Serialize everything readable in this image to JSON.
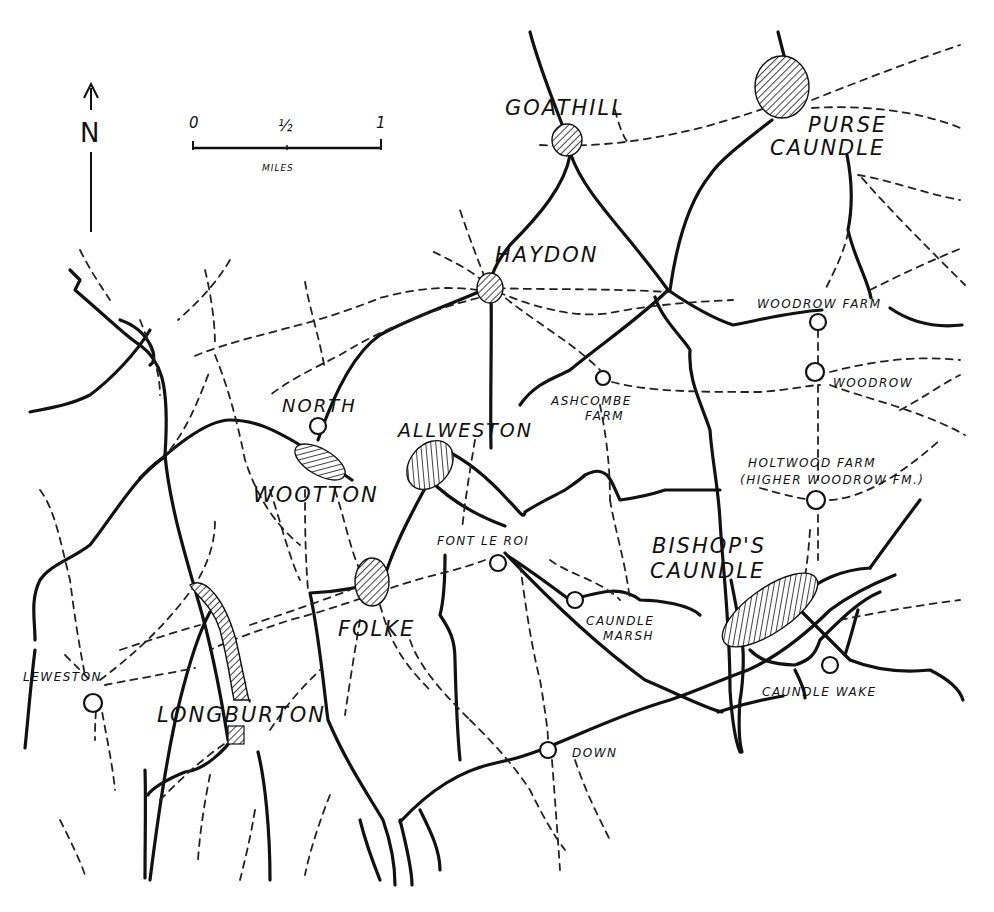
{
  "north_arrow": {
    "label": "N"
  },
  "scale_bar": {
    "ticks": [
      "0",
      "½",
      "1"
    ],
    "unit": "MILES"
  },
  "legend_colors": {
    "ink": "#111111",
    "paper": "#ffffff"
  },
  "villages": [
    {
      "id": "goathill",
      "name": "GOATHILL",
      "symbol": "hatched-settlement"
    },
    {
      "id": "purse-caundle",
      "name_line1": "PURSE",
      "name_line2": "CAUNDLE",
      "symbol": "hatched-settlement"
    },
    {
      "id": "haydon",
      "name": "HAYDON",
      "symbol": "hatched-settlement"
    },
    {
      "id": "north-wootton",
      "name_line1": "NORTH",
      "name_line2": "WOOTTON",
      "symbol": "hatched-settlement"
    },
    {
      "id": "allweston",
      "name": "ALLWESTON",
      "symbol": "hatched-settlement"
    },
    {
      "id": "folke",
      "name": "FOLKE",
      "symbol": "hatched-settlement"
    },
    {
      "id": "longburton",
      "name": "LONGBURTON",
      "symbol": "hatched-settlement"
    },
    {
      "id": "bishops-caundle",
      "name_line1": "BISHOP'S",
      "name_line2": "CAUNDLE",
      "symbol": "hatched-settlement"
    }
  ],
  "farms": [
    {
      "id": "woodrow-farm",
      "name": "WOODROW FARM",
      "symbol": "open-circle"
    },
    {
      "id": "woodrow",
      "name": "WOODROW",
      "symbol": "open-circle"
    },
    {
      "id": "ashcombe-farm",
      "name_line1": "ASHCOMBE",
      "name_line2": "FARM",
      "symbol": "open-circle"
    },
    {
      "id": "holtwood-farm",
      "name_line1": "HOLTWOOD FARM",
      "name_line2": "(HIGHER WOODROW FM.)",
      "symbol": "open-circle"
    },
    {
      "id": "font-le-roi",
      "name": "FONT LE ROI",
      "symbol": "open-circle"
    },
    {
      "id": "caundle-marsh",
      "name_line1": "CAUNDLE",
      "name_line2": "MARSH",
      "symbol": "open-circle"
    },
    {
      "id": "caundle-wake",
      "name": "CAUNDLE WAKE",
      "symbol": "open-circle"
    },
    {
      "id": "leweston",
      "name": "LEWESTON",
      "symbol": "open-circle"
    },
    {
      "id": "down",
      "name": "DOWN",
      "symbol": "open-circle"
    }
  ],
  "line_types": {
    "road": "solid",
    "footpath": "dashed"
  }
}
